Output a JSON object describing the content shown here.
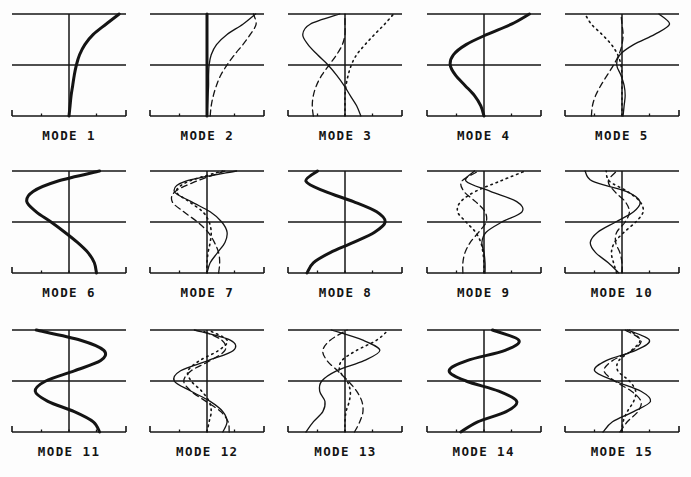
{
  "figure": {
    "title": "",
    "background_color": "#fdfdfd",
    "ink_color": "#141414",
    "grid": {
      "columns": 5,
      "rows": 3,
      "panel_count": 15
    }
  },
  "axes_style": {
    "top_rule": true,
    "mid_rule": true,
    "bottom_axis": true,
    "vertical_zero_axis": true,
    "bottom_tick_count": 5,
    "end_tick_direction": "up"
  },
  "line_styles": {
    "thick_solid": {
      "name": "thick-solid",
      "width": 3.0,
      "dash": "none",
      "color": "#141414"
    },
    "thin_solid": {
      "name": "thin-solid",
      "width": 1.3,
      "dash": "none",
      "color": "#141414"
    },
    "dashed": {
      "name": "dashed",
      "width": 1.3,
      "dash": "6,4",
      "color": "#141414"
    },
    "dotted": {
      "name": "dotted",
      "width": 1.6,
      "dash": "1.5,4",
      "color": "#141414"
    }
  },
  "chart_data": {
    "type": "line",
    "xlabel": "",
    "ylabel": "",
    "xlim": [
      -1,
      1
    ],
    "ylim": [
      0,
      1
    ],
    "grid": true,
    "legend": "none",
    "orientation": "vertical-profile",
    "note": "Each panel plots horizontal amplitude (x) against depth/height (y, 0 at bottom to 1 at top). Values are sampled at 11 equally spaced y levels from y=0 (bottom) to y=1 (top).",
    "y_samples": [
      0,
      0.1,
      0.2,
      0.3,
      0.4,
      0.5,
      0.6,
      0.7,
      0.8,
      0.9,
      1.0
    ],
    "panels": [
      {
        "label": "MODE 1",
        "index": 1,
        "series": [
          {
            "name": "mode-1-primary",
            "style": "thick_solid",
            "values": [
              0.0,
              0.02,
              0.04,
              0.07,
              0.1,
              0.14,
              0.2,
              0.3,
              0.46,
              0.7,
              0.95
            ]
          }
        ]
      },
      {
        "label": "MODE 2",
        "index": 2,
        "series": [
          {
            "name": "mode-2-primary",
            "style": "thick_solid",
            "values": [
              0.0,
              0.0,
              0.0,
              0.0,
              0.0,
              0.0,
              0.0,
              0.0,
              0.0,
              0.0,
              0.0
            ]
          },
          {
            "name": "mode-2-secondary",
            "style": "thin_solid",
            "values": [
              0.0,
              0.01,
              0.02,
              0.03,
              0.03,
              0.04,
              0.08,
              0.18,
              0.38,
              0.68,
              0.92
            ]
          },
          {
            "name": "mode-2-tertiary",
            "style": "dashed",
            "values": [
              0.06,
              0.08,
              0.12,
              0.18,
              0.26,
              0.38,
              0.52,
              0.68,
              0.82,
              0.93,
              0.88
            ]
          }
        ]
      },
      {
        "label": "MODE 3",
        "index": 3,
        "series": [
          {
            "name": "mode-3-primary",
            "style": "thin_solid",
            "values": [
              0.3,
              0.22,
              0.1,
              -0.02,
              -0.16,
              -0.32,
              -0.52,
              -0.7,
              -0.8,
              -0.66,
              -0.1
            ]
          },
          {
            "name": "mode-3-secondary",
            "style": "dotted",
            "values": [
              0.0,
              0.0,
              0.0,
              0.02,
              0.06,
              0.12,
              0.22,
              0.38,
              0.56,
              0.75,
              0.92
            ]
          },
          {
            "name": "mode-3-tertiary",
            "style": "dashed",
            "values": [
              -0.6,
              -0.62,
              -0.6,
              -0.54,
              -0.44,
              -0.3,
              -0.16,
              -0.05,
              0.0,
              0.0,
              0.0
            ]
          }
        ]
      },
      {
        "label": "MODE 4",
        "index": 4,
        "series": [
          {
            "name": "mode-4-primary",
            "style": "thick_solid",
            "values": [
              0.0,
              -0.06,
              -0.18,
              -0.36,
              -0.54,
              -0.64,
              -0.58,
              -0.34,
              0.06,
              0.52,
              0.86
            ]
          }
        ]
      },
      {
        "label": "MODE 5",
        "index": 5,
        "series": [
          {
            "name": "mode-5-primary",
            "style": "thin_solid",
            "values": [
              0.02,
              0.04,
              0.06,
              0.04,
              -0.02,
              -0.1,
              -0.04,
              0.22,
              0.62,
              0.9,
              0.7
            ]
          },
          {
            "name": "mode-5-secondary",
            "style": "dashed",
            "values": [
              -0.58,
              -0.56,
              -0.5,
              -0.4,
              -0.28,
              -0.16,
              -0.06,
              0.0,
              0.02,
              0.0,
              -0.02
            ]
          },
          {
            "name": "mode-5-tertiary",
            "style": "dotted",
            "values": [
              0.0,
              0.0,
              0.0,
              0.0,
              0.0,
              -0.02,
              -0.08,
              -0.2,
              -0.38,
              -0.58,
              -0.7
            ]
          }
        ]
      },
      {
        "label": "MODE 6",
        "index": 6,
        "series": [
          {
            "name": "mode-6-primary",
            "style": "thick_solid",
            "values": [
              0.52,
              0.48,
              0.36,
              0.16,
              -0.08,
              -0.34,
              -0.62,
              -0.8,
              -0.68,
              -0.22,
              0.58
            ]
          }
        ]
      },
      {
        "label": "MODE 7",
        "index": 7,
        "series": [
          {
            "name": "mode-7-primary",
            "style": "thin_solid",
            "values": [
              0.0,
              0.06,
              0.2,
              0.34,
              0.38,
              0.28,
              0.06,
              -0.3,
              -0.62,
              -0.4,
              0.56
            ]
          },
          {
            "name": "mode-7-secondary",
            "style": "dashed",
            "values": [
              0.22,
              0.24,
              0.22,
              0.14,
              0.02,
              -0.18,
              -0.44,
              -0.66,
              -0.6,
              -0.2,
              0.34
            ]
          },
          {
            "name": "mode-7-tertiary",
            "style": "dotted",
            "values": [
              0.0,
              0.0,
              0.02,
              0.06,
              0.08,
              0.04,
              -0.08,
              -0.34,
              -0.58,
              -0.34,
              0.3
            ]
          }
        ]
      },
      {
        "label": "MODE 8",
        "index": 8,
        "series": [
          {
            "name": "mode-8-primary",
            "style": "thick_solid",
            "values": [
              -0.72,
              -0.6,
              -0.28,
              0.16,
              0.56,
              0.76,
              0.6,
              0.16,
              -0.38,
              -0.74,
              -0.52
            ]
          }
        ]
      },
      {
        "label": "MODE 9",
        "index": 9,
        "series": [
          {
            "name": "mode-9-primary",
            "style": "thin_solid",
            "values": [
              0.02,
              0.02,
              0.0,
              -0.04,
              0.04,
              0.34,
              0.72,
              0.62,
              0.12,
              -0.34,
              -0.18
            ]
          },
          {
            "name": "mode-9-secondary",
            "style": "dashed",
            "values": [
              -0.4,
              -0.4,
              -0.36,
              -0.26,
              -0.1,
              0.04,
              0.02,
              -0.16,
              -0.38,
              -0.42,
              -0.1
            ]
          },
          {
            "name": "mode-9-tertiary",
            "style": "dotted",
            "values": [
              0.0,
              0.0,
              -0.02,
              -0.06,
              -0.16,
              -0.34,
              -0.5,
              -0.44,
              -0.16,
              0.3,
              0.78
            ]
          }
        ]
      },
      {
        "label": "MODE 10",
        "index": 10,
        "series": [
          {
            "name": "mode-10-primary",
            "style": "thin_solid",
            "values": [
              -0.06,
              -0.26,
              -0.5,
              -0.6,
              -0.46,
              -0.12,
              0.22,
              0.34,
              0.08,
              -0.56,
              -0.7
            ]
          },
          {
            "name": "mode-10-secondary",
            "style": "dotted",
            "values": [
              -0.1,
              -0.16,
              -0.2,
              -0.14,
              0.04,
              0.26,
              0.4,
              0.34,
              0.1,
              -0.24,
              -0.3
            ]
          },
          {
            "name": "mode-10-tertiary",
            "style": "dashed",
            "values": [
              0.0,
              0.0,
              -0.04,
              -0.12,
              -0.1,
              0.06,
              0.14,
              0.06,
              -0.14,
              -0.26,
              -0.1
            ]
          }
        ]
      },
      {
        "label": "MODE 11",
        "index": 11,
        "series": [
          {
            "name": "mode-11-primary",
            "style": "thick_solid",
            "values": [
              0.58,
              0.46,
              0.1,
              -0.4,
              -0.64,
              -0.44,
              0.1,
              0.6,
              0.66,
              0.22,
              -0.62
            ]
          }
        ]
      },
      {
        "label": "MODE 12",
        "index": 12,
        "series": [
          {
            "name": "mode-12-primary",
            "style": "thin_solid",
            "values": [
              0.3,
              0.38,
              0.3,
              0.06,
              -0.3,
              -0.62,
              -0.5,
              0.02,
              0.5,
              0.44,
              -0.24
            ]
          },
          {
            "name": "mode-12-secondary",
            "style": "dashed",
            "values": [
              0.42,
              0.4,
              0.26,
              -0.02,
              -0.3,
              -0.44,
              -0.3,
              0.06,
              0.34,
              0.28,
              -0.12
            ]
          },
          {
            "name": "mode-12-tertiary",
            "style": "dotted",
            "values": [
              0.0,
              0.04,
              0.08,
              0.04,
              -0.1,
              -0.3,
              -0.36,
              -0.14,
              0.22,
              0.38,
              0.02
            ]
          }
        ]
      },
      {
        "label": "MODE 13",
        "index": 13,
        "series": [
          {
            "name": "mode-13-primary",
            "style": "thin_solid",
            "values": [
              -0.74,
              -0.6,
              -0.42,
              -0.38,
              -0.48,
              -0.44,
              -0.16,
              0.36,
              0.66,
              0.34,
              -0.26
            ]
          },
          {
            "name": "mode-13-secondary",
            "style": "dashed",
            "values": [
              0.18,
              0.28,
              0.34,
              0.32,
              0.22,
              0.06,
              -0.14,
              -0.34,
              -0.42,
              -0.28,
              0.04
            ]
          },
          {
            "name": "mode-13-tertiary",
            "style": "dotted",
            "values": [
              0.0,
              0.0,
              0.02,
              0.08,
              0.1,
              0.04,
              -0.1,
              -0.06,
              0.22,
              0.6,
              0.82
            ]
          }
        ]
      },
      {
        "label": "MODE 14",
        "index": 14,
        "series": [
          {
            "name": "mode-14-primary",
            "style": "thick_solid",
            "values": [
              -0.44,
              -0.12,
              0.42,
              0.62,
              0.28,
              -0.34,
              -0.66,
              -0.32,
              0.4,
              0.66,
              0.16
            ]
          }
        ]
      },
      {
        "label": "MODE 15",
        "index": 15,
        "series": [
          {
            "name": "mode-15-primary",
            "style": "thin_solid",
            "values": [
              -0.36,
              -0.18,
              0.22,
              0.54,
              0.36,
              -0.14,
              -0.52,
              -0.3,
              0.26,
              0.52,
              0.1
            ]
          },
          {
            "name": "mode-15-secondary",
            "style": "dashed",
            "values": [
              -0.04,
              0.1,
              0.3,
              0.36,
              0.18,
              -0.14,
              -0.34,
              -0.18,
              0.2,
              0.36,
              0.06
            ]
          },
          {
            "name": "mode-15-tertiary",
            "style": "dotted",
            "values": [
              0.0,
              0.02,
              0.1,
              0.22,
              0.26,
              0.14,
              -0.08,
              -0.06,
              0.18,
              0.34,
              0.14
            ]
          }
        ]
      }
    ]
  }
}
